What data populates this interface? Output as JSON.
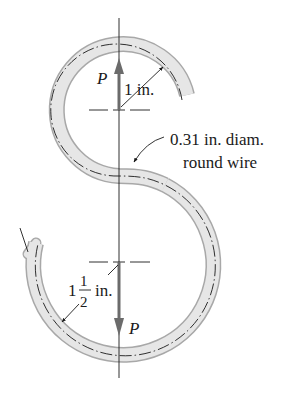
{
  "figure": {
    "load_label_top": "P",
    "load_label_bottom": "P",
    "radius_top_label": "1 in.",
    "radius_bottom_whole": "1",
    "radius_bottom_num": "1",
    "radius_bottom_den": "2",
    "radius_bottom_unit": "in.",
    "wire_label_line1": "0.31 in. diam.",
    "wire_label_line2": "round wire"
  },
  "colors": {
    "wire_fill": "#e6e6e6",
    "wire_edge": "#a8a8a8",
    "arrow": "#6b6b6b",
    "line": "#1a1a1a"
  }
}
